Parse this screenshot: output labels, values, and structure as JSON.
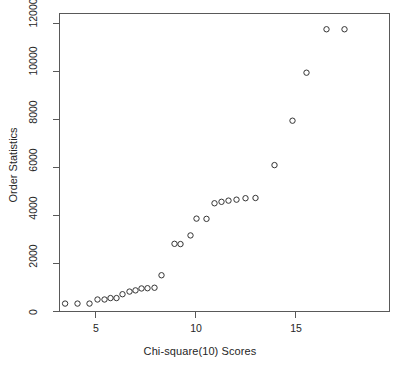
{
  "chart_data": {
    "type": "scatter",
    "title": "",
    "xlabel": "Chi-square(10) Scores",
    "ylabel": "Order Statistics",
    "xlim": [
      3.0,
      19.4
    ],
    "ylim": [
      -250,
      12600
    ],
    "xticks": [
      5,
      10,
      15
    ],
    "yticks": [
      0,
      2000,
      4000,
      6000,
      8000,
      10000,
      12000
    ],
    "xticklabels": [
      "5",
      "10",
      "15"
    ],
    "yticklabels": [
      "0",
      "2000",
      "4000",
      "6000",
      "8000",
      "10000",
      "12000"
    ],
    "grid": false,
    "legend": null,
    "marker": "open-circle",
    "marker_color": "#333333",
    "point_count": 30,
    "x": [
      3.48,
      4.1,
      4.7,
      5.1,
      5.45,
      5.75,
      6.05,
      6.35,
      6.7,
      7.0,
      7.3,
      7.6,
      7.95,
      8.3,
      8.95,
      9.25,
      9.75,
      10.05,
      10.55,
      10.95,
      11.3,
      11.65,
      12.05,
      12.5,
      13.0,
      13.95,
      14.85,
      15.55,
      16.55,
      17.45
    ],
    "y": [
      330,
      330,
      330,
      500,
      500,
      560,
      560,
      720,
      830,
      880,
      960,
      970,
      990,
      1510,
      2820,
      2810,
      3170,
      3870,
      3860,
      4510,
      4570,
      4620,
      4660,
      4720,
      4730,
      6100,
      7950,
      9950,
      11760,
      11760
    ],
    "points": [
      {
        "x": 3.48,
        "y": 330
      },
      {
        "x": 4.1,
        "y": 330
      },
      {
        "x": 4.7,
        "y": 330
      },
      {
        "x": 5.1,
        "y": 500
      },
      {
        "x": 5.45,
        "y": 500
      },
      {
        "x": 5.75,
        "y": 560
      },
      {
        "x": 6.05,
        "y": 560
      },
      {
        "x": 6.35,
        "y": 720
      },
      {
        "x": 6.7,
        "y": 830
      },
      {
        "x": 7.0,
        "y": 880
      },
      {
        "x": 7.3,
        "y": 960
      },
      {
        "x": 7.6,
        "y": 970
      },
      {
        "x": 7.95,
        "y": 990
      },
      {
        "x": 8.3,
        "y": 1510
      },
      {
        "x": 8.95,
        "y": 2820
      },
      {
        "x": 9.25,
        "y": 2810
      },
      {
        "x": 9.75,
        "y": 3170
      },
      {
        "x": 10.05,
        "y": 3870
      },
      {
        "x": 10.55,
        "y": 3860
      },
      {
        "x": 10.95,
        "y": 4510
      },
      {
        "x": 11.3,
        "y": 4570
      },
      {
        "x": 11.65,
        "y": 4620
      },
      {
        "x": 12.05,
        "y": 4660
      },
      {
        "x": 12.5,
        "y": 4720
      },
      {
        "x": 13.0,
        "y": 4730
      },
      {
        "x": 13.95,
        "y": 6100
      },
      {
        "x": 14.85,
        "y": 7950
      },
      {
        "x": 15.55,
        "y": 9950
      },
      {
        "x": 16.55,
        "y": 11760
      },
      {
        "x": 17.45,
        "y": 11760
      }
    ]
  },
  "axes": {
    "frame_color": "#4d4d4d",
    "background": "#ffffff"
  }
}
